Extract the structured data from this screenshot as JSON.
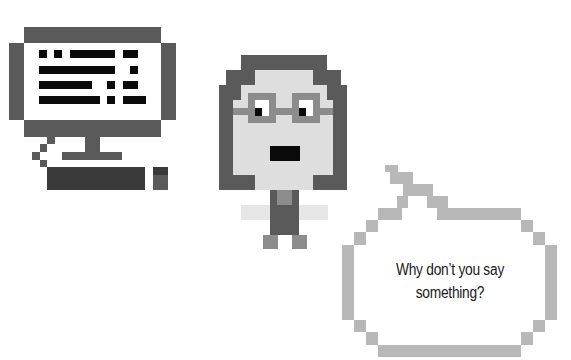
{
  "scene": {
    "description": "Pixel art illustration: a desktop computer, a person with glasses, and a speech bubble",
    "colors": {
      "dark_gray": "#5a5a5a",
      "darker_gray": "#3a3a3a",
      "black": "#0a0a0a",
      "mid_gray": "#8c8c8c",
      "light_gray": "#dedede",
      "bubble_gray": "#b8b8b8"
    }
  },
  "computer": {
    "icon": "desktop-computer-icon"
  },
  "person": {
    "icon": "person-with-glasses-icon"
  },
  "speech_bubble": {
    "line1": "Why don’t you say",
    "line2": "something?"
  }
}
